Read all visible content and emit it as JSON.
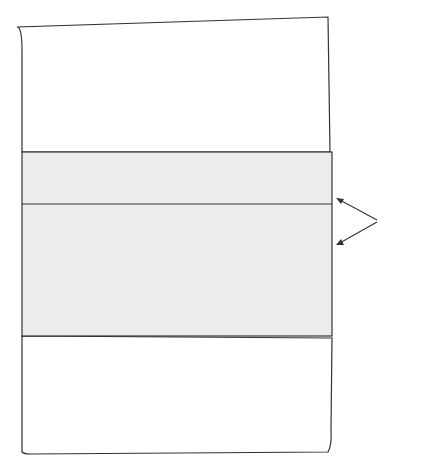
{
  "diagram": {
    "value_label": "678",
    "columns": [
      {
        "place": "10,000,000,000s",
        "name": "10 billions",
        "bold": false,
        "x": 45,
        "upper": [
          163,
          180
        ],
        "lower": [
          262,
          278,
          294,
          310,
          326
        ]
      },
      {
        "place": "1,000,000,000s",
        "name": "billions",
        "bold": true,
        "x": 71,
        "upper": [
          163,
          180
        ],
        "lower": [
          262,
          278,
          294,
          310,
          326
        ]
      },
      {
        "place": "100,000,000s",
        "name": "100 millions",
        "bold": false,
        "x": 97,
        "upper": [
          163,
          180
        ],
        "lower": [
          262,
          278,
          294,
          310,
          326
        ]
      },
      {
        "place": "10,000,000s",
        "name": "10 millions",
        "bold": false,
        "x": 123,
        "upper": [
          163,
          180
        ],
        "lower": [
          262,
          278,
          294,
          310,
          326
        ]
      },
      {
        "place": "1,000,000s",
        "name": "millions",
        "bold": true,
        "x": 149,
        "upper": [
          163,
          180
        ],
        "lower": [
          262,
          278,
          294,
          310,
          326
        ]
      },
      {
        "place": "100,000s",
        "name": "100 thousands",
        "bold": false,
        "x": 175,
        "upper": [
          163,
          180
        ],
        "lower": [
          262,
          278,
          294,
          310,
          326
        ]
      },
      {
        "place": "10,000s",
        "name": "10 thousands",
        "bold": false,
        "x": 201,
        "upper": [
          163,
          180
        ],
        "lower": [
          262,
          278,
          294,
          310,
          326
        ]
      },
      {
        "place": "1,000s",
        "name": "thousands",
        "bold": true,
        "x": 227,
        "upper": [
          163,
          180
        ],
        "lower": [
          262,
          278,
          294,
          310,
          326
        ]
      },
      {
        "place": "100s",
        "name": "hundreds",
        "bold": false,
        "x": 253,
        "upper": [
          163,
          196
        ],
        "lower": [
          212,
          278,
          294,
          310,
          326
        ]
      },
      {
        "place": "10s",
        "name": "tens",
        "bold": false,
        "x": 279,
        "upper": [
          163,
          196
        ],
        "lower": [
          212,
          228,
          294,
          310,
          326
        ]
      },
      {
        "place": "1s",
        "name": "ones",
        "bold": false,
        "x": 305,
        "upper": [
          163,
          196
        ],
        "lower": [
          212,
          228,
          244,
          310,
          326
        ]
      }
    ],
    "annotations": [
      {
        "text": "500",
        "x": 262,
        "y": 172
      },
      {
        "text": "100",
        "x": 262,
        "y": 222
      },
      {
        "text": "50",
        "x": 288,
        "y": 172
      },
      {
        "text": "20",
        "x": 288,
        "y": 238
      },
      {
        "text": "5",
        "x": 314,
        "y": 180
      },
      {
        "text": "3",
        "x": 314,
        "y": 254
      }
    ],
    "colors": {
      "bead_fill": "#5a5a5a",
      "bead_stroke": "#2a2a2a",
      "frame_fill": "#ececec",
      "line": "#333333"
    }
  }
}
